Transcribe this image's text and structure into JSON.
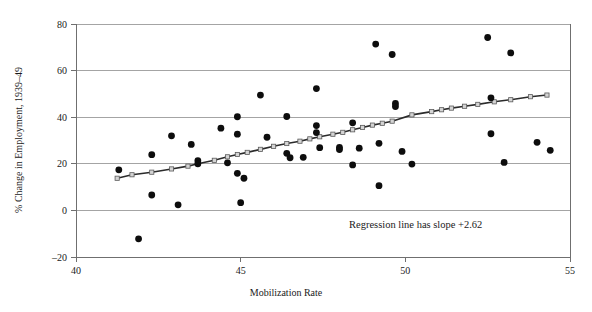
{
  "chart_data": {
    "type": "scatter",
    "title": "",
    "xlabel": "Mobilization Rate",
    "ylabel": "% Change in Employment, 1939–49",
    "xlim": [
      40,
      55
    ],
    "ylim": [
      -20,
      80
    ],
    "xticks": [
      40,
      45,
      50,
      55
    ],
    "xtick_labels": [
      "40",
      "45",
      "50",
      "55"
    ],
    "yticks": [
      -20,
      0,
      20,
      40,
      60,
      80
    ],
    "ytick_labels": [
      "–20",
      "0",
      "20",
      "40",
      "60",
      "80"
    ],
    "grid": true,
    "grid_axis": "y",
    "legend": "none",
    "annotations": [
      {
        "text": "Regression line has slope +2.62",
        "x": 50.1,
        "y": -5.0
      }
    ],
    "series": [
      {
        "name": "States",
        "type": "scatter",
        "marker": "filled-circle",
        "color": "#0d0d0d",
        "points": [
          [
            41.3,
            17.4
          ],
          [
            41.9,
            -12.2
          ],
          [
            42.3,
            6.6
          ],
          [
            42.3,
            23.9
          ],
          [
            42.9,
            32.0
          ],
          [
            43.1,
            2.4
          ],
          [
            43.5,
            28.3
          ],
          [
            43.7,
            21.3
          ],
          [
            43.7,
            20.0
          ],
          [
            44.4,
            35.3
          ],
          [
            44.6,
            20.4
          ],
          [
            44.9,
            40.2
          ],
          [
            44.9,
            32.7
          ],
          [
            44.9,
            15.9
          ],
          [
            45.0,
            3.3
          ],
          [
            45.1,
            13.8
          ],
          [
            45.6,
            49.5
          ],
          [
            45.8,
            31.4
          ],
          [
            46.4,
            40.3
          ],
          [
            46.4,
            24.5
          ],
          [
            46.5,
            22.6
          ],
          [
            46.9,
            22.8
          ],
          [
            47.3,
            52.3
          ],
          [
            47.3,
            36.4
          ],
          [
            47.3,
            33.4
          ],
          [
            47.4,
            26.9
          ],
          [
            48.0,
            27.0
          ],
          [
            48.0,
            26.1
          ],
          [
            48.4,
            37.6
          ],
          [
            48.4,
            19.5
          ],
          [
            48.6,
            26.7
          ],
          [
            49.1,
            71.4
          ],
          [
            49.2,
            28.8
          ],
          [
            49.2,
            10.6
          ],
          [
            49.6,
            66.9
          ],
          [
            49.7,
            45.9
          ],
          [
            49.7,
            44.6
          ],
          [
            49.9,
            25.3
          ],
          [
            50.2,
            19.9
          ],
          [
            52.5,
            74.2
          ],
          [
            52.6,
            48.3
          ],
          [
            52.6,
            32.9
          ],
          [
            53.2,
            67.6
          ],
          [
            53.0,
            20.6
          ],
          [
            54.0,
            29.2
          ],
          [
            54.4,
            25.8
          ]
        ]
      },
      {
        "name": "Regression line",
        "type": "line",
        "marker": "open-square",
        "color": "#2b2b2b",
        "slope": 2.62,
        "points": [
          [
            41.25,
            13.8
          ],
          [
            41.7,
            15.3
          ],
          [
            42.3,
            16.4
          ],
          [
            42.9,
            17.8
          ],
          [
            43.4,
            19.0
          ],
          [
            43.7,
            20.0
          ],
          [
            44.2,
            21.5
          ],
          [
            44.6,
            23.0
          ],
          [
            44.9,
            24.0
          ],
          [
            45.2,
            24.9
          ],
          [
            45.6,
            26.2
          ],
          [
            46.0,
            27.5
          ],
          [
            46.4,
            28.7
          ],
          [
            46.8,
            29.7
          ],
          [
            47.1,
            30.7
          ],
          [
            47.4,
            31.6
          ],
          [
            47.8,
            32.7
          ],
          [
            48.1,
            33.5
          ],
          [
            48.4,
            34.6
          ],
          [
            48.7,
            35.6
          ],
          [
            49.0,
            36.6
          ],
          [
            49.3,
            37.4
          ],
          [
            49.6,
            38.3
          ],
          [
            50.2,
            41.0
          ],
          [
            50.8,
            42.4
          ],
          [
            51.1,
            43.2
          ],
          [
            51.4,
            43.9
          ],
          [
            51.8,
            44.7
          ],
          [
            52.2,
            45.5
          ],
          [
            52.7,
            46.6
          ],
          [
            53.2,
            47.5
          ],
          [
            53.8,
            48.8
          ],
          [
            54.3,
            49.5
          ]
        ]
      }
    ]
  }
}
